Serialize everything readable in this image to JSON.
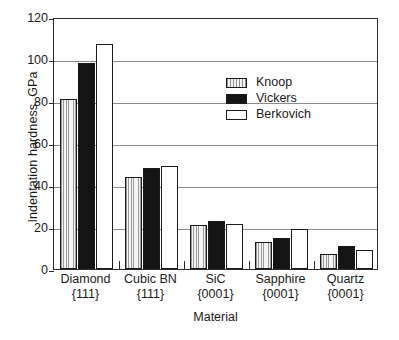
{
  "chart_data": {
    "type": "bar",
    "title": "",
    "xlabel": "Material",
    "ylabel": "Indentation hardness, GPa",
    "ylim": [
      0,
      120
    ],
    "ytick_step": 20,
    "yticks": [
      0,
      20,
      40,
      60,
      80,
      100,
      120
    ],
    "ytick_labels": [
      "0",
      "20",
      "40",
      "60",
      "80",
      "100",
      "120"
    ],
    "grid": "horizontal",
    "legend_position": "upper-center",
    "categories": [
      "Diamond {111}",
      "Cubic BN {111}",
      "SiC {0001}",
      "Sapphire {0001}",
      "Quartz {0001}"
    ],
    "category_lines": [
      {
        "name": "Diamond",
        "plane": "{111}"
      },
      {
        "name": "Cubic BN",
        "plane": "{111}"
      },
      {
        "name": "SiC",
        "plane": "{0001}"
      },
      {
        "name": "Sapphire",
        "plane": "{0001}"
      },
      {
        "name": "Quartz",
        "plane": "{0001}"
      }
    ],
    "series": [
      {
        "name": "Knoop",
        "fill": "vertical-hatch",
        "color": "#f2f2f2",
        "values": [
          81,
          44,
          21,
          13,
          7
        ]
      },
      {
        "name": "Vickers",
        "fill": "solid",
        "color": "#141414",
        "values": [
          98,
          48,
          23,
          15,
          11
        ]
      },
      {
        "name": "Berkovich",
        "fill": "none",
        "color": "#ffffff",
        "values": [
          107,
          49,
          21.5,
          19,
          9
        ]
      }
    ]
  },
  "legend": {
    "items": [
      {
        "label": "Knoop"
      },
      {
        "label": "Vickers"
      },
      {
        "label": "Berkovich"
      }
    ]
  },
  "axes": {
    "y_title": "Indentation hardness, GPa",
    "x_title": "Material"
  },
  "colors": {
    "axis": "#2b2b2b",
    "gridline": "#8c8c8c",
    "bar_outline": "#1a1a1a",
    "knoop_fill": "#f2f2f2",
    "vickers_fill": "#141414",
    "berkovich_fill": "#ffffff",
    "background": "#ffffff"
  }
}
